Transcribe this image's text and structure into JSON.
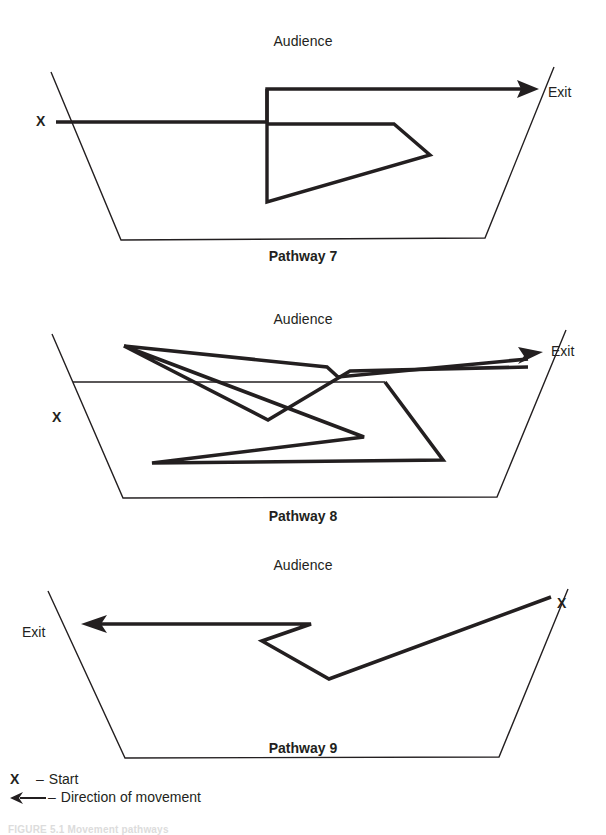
{
  "figure": {
    "caption": "FIGURE 5.1   Movement pathways",
    "background": "#ffffff",
    "ink_color": "#231f20"
  },
  "legend": {
    "items": [
      {
        "key": "X",
        "key_type": "letter",
        "separator": "–",
        "label": "Start"
      },
      {
        "key": "←",
        "key_type": "arrow",
        "separator": "–",
        "label": "Direction of movement"
      }
    ]
  },
  "panels": [
    {
      "id": "pathway-7",
      "title": "Pathway 7",
      "audience_label": "Audience",
      "exit_label": "Exit",
      "start_marker": "X",
      "start_side": "left",
      "exit_side": "right",
      "stage_outline": {
        "shape": "trapezoid-open-top",
        "top_left": [
          51,
          72
        ],
        "bottom_left": [
          121,
          240
        ],
        "bottom_right": [
          485,
          238
        ],
        "top_right": [
          554,
          67
        ]
      },
      "path_points": [
        [
          56,
          122
        ],
        [
          267,
          122
        ],
        [
          267,
          89
        ],
        [
          533,
          89
        ]
      ],
      "path_points_secondary": [
        [
          267,
          89
        ],
        [
          267,
          202
        ],
        [
          430,
          155
        ],
        [
          394,
          124
        ],
        [
          267,
          124
        ]
      ],
      "arrow_head_at": [
        533,
        89
      ],
      "arrow_direction": "right"
    },
    {
      "id": "pathway-8",
      "title": "Pathway 8",
      "audience_label": "Audience",
      "exit_label": "Exit",
      "start_marker": "X",
      "start_side": "left",
      "exit_side": "right",
      "stage_outline": {
        "shape": "trapezoid-open-top",
        "top_left": [
          52,
          334
        ],
        "bottom_left": [
          123,
          498
        ],
        "bottom_right": [
          497,
          497
        ],
        "top_right": [
          566,
          330
        ]
      },
      "path_points": [
        [
          73,
          382
        ],
        [
          385,
          382
        ],
        [
          443,
          460
        ],
        [
          152,
          463
        ],
        [
          364,
          437
        ],
        [
          124,
          346
        ],
        [
          251,
          407
        ],
        [
          268,
          420
        ],
        [
          468,
          383
        ],
        [
          528,
          367
        ]
      ],
      "arrow_head_at": [
        528,
        367
      ],
      "arrow_direction": "right"
    },
    {
      "id": "pathway-9",
      "title": "Pathway 9",
      "audience_label": "Audience",
      "exit_label": "Exit",
      "start_marker": "X",
      "start_side": "right",
      "exit_side": "left",
      "stage_outline": {
        "shape": "trapezoid-open-top",
        "top_left": [
          48,
          591
        ],
        "bottom_left": [
          125,
          758
        ],
        "bottom_right": [
          499,
          757
        ],
        "top_right": [
          568,
          589
        ]
      },
      "path_points": [
        [
          551,
          597
        ],
        [
          329,
          679
        ],
        [
          262,
          641
        ],
        [
          311,
          624
        ],
        [
          87,
          624
        ]
      ],
      "arrow_head_at": [
        87,
        624
      ],
      "arrow_direction": "left"
    }
  ]
}
